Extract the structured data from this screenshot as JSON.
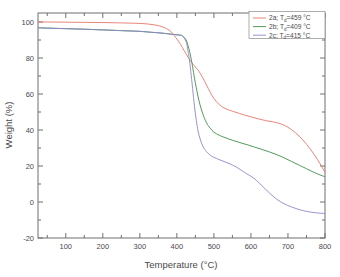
{
  "chart_data": {
    "type": "line",
    "title": "",
    "xlabel": "Temperature (°C)",
    "ylabel": "Weight (%)",
    "xlim": [
      25,
      800
    ],
    "ylim": [
      -20,
      105
    ],
    "xticks": [
      100,
      200,
      300,
      400,
      500,
      600,
      700,
      800
    ],
    "yticks": [
      -20,
      0,
      20,
      40,
      60,
      80,
      100
    ],
    "grid": false,
    "legend_position": "top-right",
    "legend_entries": [
      {
        "id": "2a",
        "label": "2a; T",
        "sub": "d",
        "label_tail": "=459 °C",
        "full": "2a; Td=459 °C",
        "color": "#e8766a",
        "Td": 459
      },
      {
        "id": "2b",
        "label": "2b; T",
        "sub": "d",
        "label_tail": "=409 °C",
        "full": "2b; Td=409 °C",
        "color": "#3f8f4a",
        "Td": 409
      },
      {
        "id": "2c",
        "label": "2c; T",
        "sub": "d",
        "label_tail": "=415 °C",
        "full": "2c; Td=415 °C",
        "color": "#8f86c9",
        "Td": 415
      }
    ],
    "series": [
      {
        "name": "2a; Td=459 °C",
        "color": "#e8766a",
        "x": [
          25,
          50,
          100,
          150,
          200,
          250,
          300,
          325,
          350,
          370,
          385,
          400,
          410,
          420,
          430,
          440,
          450,
          460,
          470,
          480,
          490,
          500,
          515,
          530,
          545,
          560,
          580,
          600,
          620,
          640,
          660,
          680,
          700,
          720,
          740,
          760,
          780,
          800
        ],
        "y": [
          100.0,
          100.0,
          99.9,
          99.8,
          99.7,
          99.5,
          99.2,
          98.8,
          98.0,
          96.5,
          94.5,
          90.5,
          87.5,
          84.0,
          80.5,
          77.5,
          75.0,
          72.5,
          69.0,
          65.0,
          61.0,
          57.5,
          54.0,
          52.0,
          50.8,
          49.8,
          48.5,
          47.3,
          46.2,
          45.2,
          44.5,
          43.5,
          41.5,
          38.5,
          34.5,
          29.5,
          23.5,
          16.5
        ]
      },
      {
        "name": "2b; Td=409 °C",
        "color": "#3f8f4a",
        "x": [
          25,
          50,
          100,
          150,
          200,
          250,
          300,
          330,
          350,
          370,
          385,
          395,
          405,
          415,
          425,
          430,
          435,
          440,
          445,
          450,
          460,
          470,
          480,
          490,
          500,
          515,
          530,
          550,
          570,
          590,
          610,
          630,
          650,
          670,
          690,
          710,
          730,
          750,
          775,
          800
        ],
        "y": [
          96.8,
          96.6,
          96.3,
          96.0,
          95.6,
          95.2,
          94.8,
          94.3,
          94.0,
          93.6,
          93.2,
          93.0,
          92.8,
          92.3,
          90.0,
          87.0,
          83.0,
          78.0,
          72.0,
          66.0,
          56.0,
          49.0,
          44.0,
          41.0,
          38.8,
          37.0,
          35.8,
          34.3,
          33.0,
          31.8,
          30.5,
          29.2,
          27.8,
          26.3,
          24.5,
          22.5,
          20.5,
          18.5,
          16.0,
          14.0
        ]
      },
      {
        "name": "2c; Td=415 °C",
        "color": "#8f86c9",
        "x": [
          25,
          50,
          100,
          150,
          200,
          250,
          300,
          330,
          350,
          370,
          385,
          395,
          405,
          415,
          425,
          430,
          435,
          440,
          445,
          450,
          455,
          460,
          470,
          480,
          490,
          500,
          515,
          530,
          545,
          560,
          575,
          590,
          600,
          615,
          630,
          650,
          670,
          690,
          710,
          730,
          750,
          775,
          800
        ],
        "y": [
          96.8,
          96.6,
          96.3,
          96.0,
          95.6,
          95.2,
          94.8,
          94.3,
          94.0,
          93.6,
          93.2,
          93.0,
          92.8,
          92.2,
          89.0,
          84.0,
          77.0,
          68.0,
          58.0,
          49.0,
          42.0,
          37.0,
          31.0,
          28.0,
          26.0,
          24.8,
          23.5,
          22.3,
          21.0,
          19.5,
          17.5,
          15.5,
          14.3,
          12.0,
          9.0,
          5.0,
          1.5,
          -1.0,
          -2.8,
          -4.2,
          -5.2,
          -6.0,
          -6.4
        ]
      }
    ]
  },
  "axis": {
    "x_tick_labels": [
      "100",
      "200",
      "300",
      "400",
      "500",
      "600",
      "700",
      "800"
    ],
    "y_tick_labels": [
      "100",
      "80",
      "60",
      "40",
      "20",
      "0",
      "-20"
    ]
  }
}
